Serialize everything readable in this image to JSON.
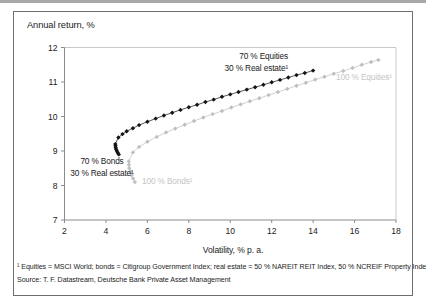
{
  "figure": {
    "footnote": "¹ Equities = MSCI World; bonds = Citigroup Government Index; real estate = 50 % NAREIT REIT Index, 50 % NCREIF Property Index",
    "source": "Source: T. F. Datastream, Deutsche Bank Private Asset Management"
  },
  "chart_data": {
    "type": "scatter",
    "title": "",
    "xlabel": "Volatility, % p. a.",
    "ylabel": "Annual return, %",
    "xlim": [
      2,
      18
    ],
    "ylim": [
      7,
      12
    ],
    "x_ticks": [
      2,
      4,
      6,
      8,
      10,
      12,
      14,
      16,
      18
    ],
    "y_ticks": [
      7,
      8,
      9,
      10,
      11,
      12
    ],
    "grid": false,
    "legend_position": "inline-annotations",
    "axis_color": "#8c8c8c",
    "frame_color": "#c9c9c9",
    "tick_label_color": "#222222",
    "series": [
      {
        "name": "frontier-bonds-to-equities",
        "description": "Efficient frontier from 100 % Bonds to 100 % Equities",
        "color": "#bfbfbf",
        "marker": "diamond",
        "points": [
          [
            5.4,
            8.1
          ],
          [
            5.31,
            8.2
          ],
          [
            5.24,
            8.3
          ],
          [
            5.18,
            8.4
          ],
          [
            5.13,
            8.5
          ],
          [
            5.11,
            8.6
          ],
          [
            5.1,
            8.7
          ],
          [
            5.3,
            8.96
          ],
          [
            5.6,
            9.12
          ],
          [
            6.0,
            9.27
          ],
          [
            6.45,
            9.41
          ],
          [
            6.9,
            9.54
          ],
          [
            7.35,
            9.65
          ],
          [
            7.8,
            9.76
          ],
          [
            8.25,
            9.87
          ],
          [
            8.7,
            9.97
          ],
          [
            9.15,
            10.07
          ],
          [
            9.6,
            10.16
          ],
          [
            10.05,
            10.26
          ],
          [
            10.5,
            10.35
          ],
          [
            10.95,
            10.44
          ],
          [
            11.4,
            10.53
          ],
          [
            11.85,
            10.62
          ],
          [
            12.3,
            10.71
          ],
          [
            12.75,
            10.8
          ],
          [
            13.2,
            10.89
          ],
          [
            13.65,
            10.98
          ],
          [
            14.1,
            11.07
          ],
          [
            14.55,
            11.15
          ],
          [
            15.0,
            11.24
          ],
          [
            15.45,
            11.32
          ],
          [
            15.9,
            11.41
          ],
          [
            16.35,
            11.5
          ],
          [
            16.8,
            11.58
          ],
          [
            17.15,
            11.64
          ]
        ]
      },
      {
        "name": "frontier-with-30pct-real-estate",
        "description": "Efficient frontier from 70 % Bonds / 30 % Real estate to 70 % Equities / 30 % Real estate",
        "color": "#141414",
        "marker": "diamond",
        "points": [
          [
            4.62,
            8.9
          ],
          [
            4.57,
            8.95
          ],
          [
            4.53,
            9.0
          ],
          [
            4.49,
            9.05
          ],
          [
            4.47,
            9.1
          ],
          [
            4.46,
            9.15
          ],
          [
            4.45,
            9.2
          ],
          [
            4.6,
            9.39
          ],
          [
            4.8,
            9.49
          ],
          [
            5.0,
            9.57
          ],
          [
            5.3,
            9.66
          ],
          [
            5.6,
            9.75
          ],
          [
            6.0,
            9.85
          ],
          [
            6.4,
            9.94
          ],
          [
            6.8,
            10.03
          ],
          [
            7.2,
            10.11
          ],
          [
            7.6,
            10.19
          ],
          [
            8.0,
            10.27
          ],
          [
            8.4,
            10.34
          ],
          [
            8.8,
            10.42
          ],
          [
            9.2,
            10.49
          ],
          [
            9.6,
            10.57
          ],
          [
            10.0,
            10.64
          ],
          [
            10.4,
            10.71
          ],
          [
            10.8,
            10.78
          ],
          [
            11.2,
            10.85
          ],
          [
            11.6,
            10.92
          ],
          [
            12.0,
            10.99
          ],
          [
            12.4,
            11.06
          ],
          [
            12.8,
            11.13
          ],
          [
            13.2,
            11.2
          ],
          [
            13.6,
            11.26
          ],
          [
            14.0,
            11.33
          ]
        ]
      }
    ],
    "key_points": [
      {
        "label": "70 % Bonds / 30 % Real estate",
        "x": 4.6,
        "y": 8.9
      },
      {
        "label": "70 % Equities / 30 % Real estate",
        "x": 14.0,
        "y": 11.3
      },
      {
        "label": "100 % Bonds",
        "x": 5.4,
        "y": 8.1
      },
      {
        "label": "100 % Equities",
        "x": 17.1,
        "y": 11.6
      }
    ],
    "annotations": [
      {
        "lines": [
          "70 % Equities",
          "30 % Real estate¹"
        ],
        "color": "#1a1a1a"
      },
      {
        "lines": [
          "100 % Equities¹"
        ],
        "color": "#c5c5c5"
      },
      {
        "lines": [
          "70 % Bonds",
          "30 % Real estate¹"
        ],
        "color": "#1a1a1a"
      },
      {
        "lines": [
          "100 % Bonds¹"
        ],
        "color": "#c5c5c5"
      }
    ]
  }
}
